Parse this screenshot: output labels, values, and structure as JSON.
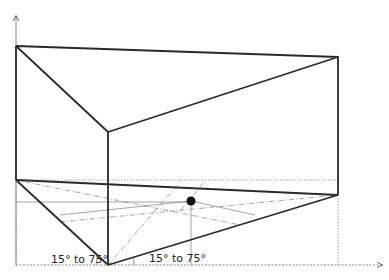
{
  "diagram": {
    "type": "isometric-box-projection",
    "colors": {
      "stroke": "#2a2a2a",
      "thin": "#555555",
      "dotted": "#777777",
      "point": "#111111",
      "background": "#ffffff"
    },
    "axes": {
      "vertical_axis": {
        "from": [
          16,
          265
        ],
        "to": [
          16,
          15
        ]
      },
      "horizontal_axis": {
        "from": [
          16,
          265
        ],
        "to": [
          383,
          265
        ]
      }
    },
    "vertices": {
      "top_back_left": [
        16,
        46
      ],
      "top_back_right": [
        338,
        57
      ],
      "top_front": [
        108,
        132
      ],
      "bottom_back_left": [
        16,
        180
      ],
      "bottom_back_right": [
        338,
        195
      ],
      "bottom_front": [
        108,
        265
      ]
    },
    "point": {
      "x": 191,
      "y": 201,
      "r": 4.5
    },
    "labels": {
      "left_angle": "15° to 75°",
      "right_angle": "15° to 75°"
    }
  }
}
